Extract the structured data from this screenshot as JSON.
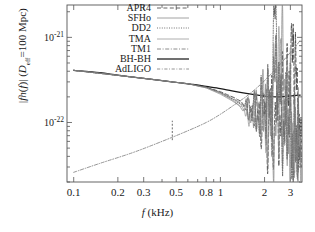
{
  "figure": {
    "kind": "log-log spectrum plot",
    "background": "#ffffff",
    "frame_color": "#555555"
  },
  "axes": {
    "x_label_plain": "f (kHz)",
    "x_label_var": "f",
    "x_label_unit": "(kHz)",
    "y_label_plain": "|f h(f)| (D_eff=100 Mpc)",
    "y_parts": {
      "bar1": "|",
      "f": "f",
      "h": "h",
      "of": "(f)",
      "bar2": "|",
      "paren_open": "(",
      "D": "D",
      "eff": "eff",
      "eq100": "=100 Mpc",
      "paren_close": ")"
    },
    "x_ticks": [
      "0.1",
      "0.2",
      "0.3",
      "0.5",
      "0.8",
      "1",
      "2",
      "3"
    ],
    "x_tick_values": [
      0.1,
      0.2,
      0.3,
      0.5,
      0.8,
      1,
      2,
      3
    ],
    "y_ticks": [
      "10",
      "10"
    ],
    "y_tick_exponents": [
      "-21",
      "-22"
    ],
    "y_tick_values": [
      1e-21,
      1e-22
    ],
    "x_range": [
      0.09,
      3.6
    ],
    "y_range": [
      2e-23,
      2.4e-21
    ],
    "x_scale": "log",
    "y_scale": "log",
    "grid": false
  },
  "legend": {
    "position": "top-center",
    "entries": [
      {
        "label": "APR4",
        "style": "dashed",
        "color": "#3a3a3a"
      },
      {
        "label": "SFHo",
        "style": "solid-thin",
        "color": "#8c8c8c"
      },
      {
        "label": "DD2",
        "style": "dotted",
        "color": "#5a5a5a"
      },
      {
        "label": "TMA",
        "style": "solid-thin",
        "color": "#9a9a9a"
      },
      {
        "label": "TM1",
        "style": "dash-dot",
        "color": "#6f6f6f"
      },
      {
        "label": "BH-BH",
        "style": "solid-thick",
        "color": "#1a1a1a"
      },
      {
        "label": "AdLIGO",
        "style": "dash-dot-light",
        "color": "#7a7a7a"
      }
    ]
  },
  "chart_data": {
    "type": "line",
    "title": "",
    "xlabel": "f (kHz)",
    "ylabel": "|f h(f)| (D_eff=100 Mpc)",
    "xscale": "log",
    "yscale": "log",
    "xlim": [
      0.09,
      3.6
    ],
    "ylim": [
      2e-23,
      2.4e-21
    ],
    "legend_position": "top-center",
    "grid": false,
    "annotations": [
      {
        "kind": "vertical-dashed-marker",
        "x": 0.47,
        "y_from": 6.2e-23,
        "y_to": 1.05e-22
      }
    ],
    "series": [
      {
        "name": "BH-BH",
        "style": "solid-thick",
        "color": "#1a1a1a",
        "x": [
          0.1,
          0.15,
          0.2,
          0.3,
          0.4,
          0.5,
          0.65,
          0.8,
          1.0,
          1.2,
          1.5,
          1.8,
          2.1,
          2.4,
          2.7,
          3.0,
          3.3,
          3.5
        ],
        "y": [
          4.1e-22,
          3.85e-22,
          3.6e-22,
          3.3e-22,
          3.1e-22,
          2.95e-22,
          2.8e-22,
          2.65e-22,
          2.5e-22,
          2.35e-22,
          2.2e-22,
          2.1e-22,
          2.02e-22,
          2e-22,
          2.02e-22,
          2.05e-22,
          2.08e-22,
          2.1e-22
        ]
      },
      {
        "name": "APR4",
        "style": "dashed",
        "color": "#3a3a3a",
        "x": [
          0.1,
          0.3,
          0.6,
          0.8,
          1.0,
          1.25,
          1.5,
          1.75,
          2.0,
          2.2,
          2.5,
          2.7,
          2.9,
          3.05,
          3.15,
          3.3,
          3.45,
          3.55
        ],
        "y": [
          4.1e-22,
          3.3e-22,
          2.85e-22,
          2.6e-22,
          2.3e-22,
          1.95e-22,
          1.6e-22,
          1.3e-22,
          1.1e-22,
          1e-22,
          1.2e-22,
          1.6e-22,
          2.4e-22,
          5.5e-22,
          8e-22,
          3e-22,
          6e-23,
          3e-23
        ]
      },
      {
        "name": "SFHo",
        "style": "solid-thin",
        "color": "#8c8c8c",
        "x": [
          0.1,
          0.3,
          0.6,
          0.8,
          1.0,
          1.2,
          1.4,
          1.6,
          1.8,
          1.95,
          2.1,
          2.3,
          2.5,
          2.65,
          2.8,
          3.0,
          3.2,
          3.4
        ],
        "y": [
          4.1e-22,
          3.3e-22,
          2.85e-22,
          2.55e-22,
          2.2e-22,
          1.85e-22,
          1.5e-22,
          1.25e-22,
          1.45e-22,
          1.85e-22,
          1.3e-22,
          6e-23,
          1.2e-22,
          9e-22,
          2e-22,
          4e-23,
          7e-23,
          3e-23
        ]
      },
      {
        "name": "DD2",
        "style": "dotted",
        "color": "#5a5a5a",
        "x": [
          0.1,
          0.3,
          0.6,
          0.8,
          1.0,
          1.2,
          1.45,
          1.7,
          1.9,
          2.1,
          2.25,
          2.35,
          2.5,
          2.7,
          2.9,
          3.1,
          3.3,
          3.5
        ],
        "y": [
          4.1e-22,
          3.3e-22,
          2.85e-22,
          2.6e-22,
          2.25e-22,
          1.9e-22,
          1.55e-22,
          1.3e-22,
          1.2e-22,
          1.6e-22,
          2.3e-22,
          1.9e-21,
          2.5e-22,
          7e-23,
          1.4e-22,
          4e-23,
          9e-23,
          3e-23
        ]
      },
      {
        "name": "TMA",
        "style": "solid-thin",
        "color": "#9a9a9a",
        "x": [
          0.1,
          0.3,
          0.6,
          0.8,
          1.0,
          1.2,
          1.4,
          1.6,
          1.85,
          2.0,
          2.2,
          2.45,
          2.6,
          2.8,
          3.0,
          3.2,
          3.4,
          3.55
        ],
        "y": [
          4.1e-22,
          3.3e-22,
          2.85e-22,
          2.55e-22,
          2.15e-22,
          1.8e-22,
          1.5e-22,
          1.2e-22,
          1.35e-22,
          1.1e-22,
          1.5e-22,
          8e-22,
          3e-22,
          8e-23,
          1.6e-22,
          5e-23,
          8e-23,
          3e-23
        ]
      },
      {
        "name": "TM1",
        "style": "dash-dot",
        "color": "#6f6f6f",
        "x": [
          0.1,
          0.3,
          0.6,
          0.8,
          1.0,
          1.2,
          1.45,
          1.65,
          1.85,
          2.05,
          2.25,
          2.4,
          2.55,
          2.75,
          2.95,
          3.15,
          3.35,
          3.5
        ],
        "y": [
          4.1e-22,
          3.3e-22,
          2.85e-22,
          2.6e-22,
          2.25e-22,
          1.95e-22,
          1.6e-22,
          1.35e-22,
          1.25e-22,
          1.7e-22,
          1.35e-22,
          5e-22,
          1.8e-22,
          6e-23,
          1.3e-22,
          4.5e-23,
          7.5e-23,
          3e-23
        ]
      },
      {
        "name": "AdLIGO",
        "style": "dash-dot-light",
        "color": "#7a7a7a",
        "note": "detector sensitivity, rises monotonically",
        "x": [
          0.1,
          0.15,
          0.25,
          0.4,
          0.6,
          0.8,
          1.0,
          1.3,
          1.6,
          2.0,
          2.4,
          2.8,
          3.2,
          3.5
        ],
        "y": [
          2.6e-23,
          3.3e-23,
          4.4e-23,
          6e-23,
          8e-23,
          1e-22,
          1.25e-22,
          1.7e-22,
          2.2e-22,
          3.1e-22,
          4.3e-22,
          5.8e-22,
          7.6e-22,
          9.2e-22
        ]
      }
    ]
  }
}
